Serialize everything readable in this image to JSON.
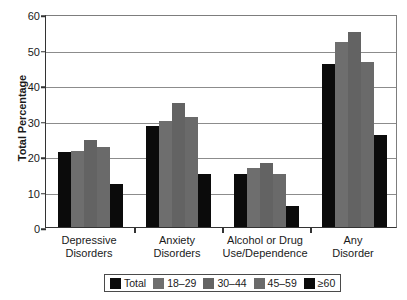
{
  "chart_data": {
    "type": "bar",
    "title": "",
    "xlabel": "",
    "ylabel": "Total Percentage",
    "ylim": [
      0,
      60
    ],
    "yticks": [
      0,
      10,
      20,
      30,
      40,
      50,
      60
    ],
    "grid": true,
    "legend_position": "bottom",
    "categories": [
      "Depressive\nDisorders",
      "Anxiety\nDisorders",
      "Alcohol or Drug\nUse/Dependence",
      "Any\nDisorder"
    ],
    "series": [
      {
        "name": "Total",
        "color": "#0b0b0b",
        "values": [
          21.0,
          28.5,
          15.0,
          46.0
        ]
      },
      {
        "name": "18–29",
        "color": "#6e6e6e",
        "values": [
          21.5,
          30.0,
          16.5,
          52.0
        ]
      },
      {
        "name": "30–44",
        "color": "#636363",
        "values": [
          24.5,
          35.0,
          18.0,
          55.0
        ]
      },
      {
        "name": "45–59",
        "color": "#6a6a6a",
        "values": [
          22.5,
          31.0,
          15.0,
          46.5
        ]
      },
      {
        "name": "≥60",
        "color": "#0b0b0b",
        "values": [
          12.0,
          15.0,
          6.0,
          26.0
        ]
      }
    ]
  }
}
